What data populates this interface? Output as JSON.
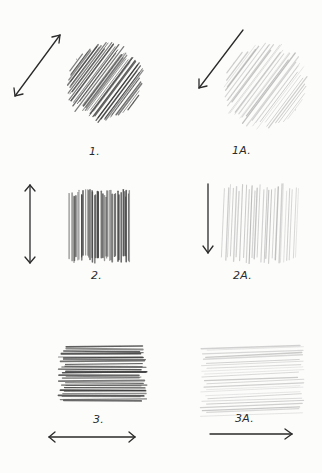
{
  "colors": {
    "paper": "#fcfcfb",
    "dark_graphite": "#3a3a3a",
    "light_graphite": "#9a9a9a",
    "ink": "#2a2a2a"
  },
  "panels": [
    {
      "id": "1",
      "label": "1.",
      "stroke": "diagonal",
      "tone": "dark",
      "arrow": "double-headed diagonal"
    },
    {
      "id": "1A",
      "label": "1A.",
      "stroke": "diagonal",
      "tone": "light",
      "arrow": "single down-left"
    },
    {
      "id": "2",
      "label": "2.",
      "stroke": "vertical",
      "tone": "dark",
      "arrow": "double-headed vertical"
    },
    {
      "id": "2A",
      "label": "2A.",
      "stroke": "vertical",
      "tone": "light",
      "arrow": "single down"
    },
    {
      "id": "3",
      "label": "3.",
      "stroke": "horizontal",
      "tone": "dark",
      "arrow": "double-headed horizontal"
    },
    {
      "id": "3A",
      "label": "3A.",
      "stroke": "horizontal",
      "tone": "light",
      "arrow": "single right"
    }
  ]
}
